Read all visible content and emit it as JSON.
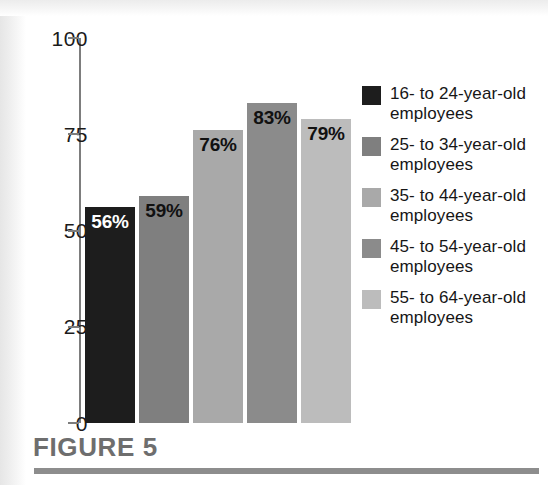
{
  "figure": {
    "caption": "FIGURE 5",
    "rule_color": "#8d8d8d",
    "caption_color": "#6e6e6e"
  },
  "axis": {
    "ticks": [
      "100",
      "75",
      "50",
      "25",
      "0"
    ],
    "line_color": "#7d7d7d"
  },
  "legend": {
    "items": [
      {
        "label": "16- to 24-year-old employees",
        "color": "#1d1d1d"
      },
      {
        "label": "25- to 34-year-old employees",
        "color": "#7f7f7f"
      },
      {
        "label": "35- to 44-year-old employees",
        "color": "#a9a9a9"
      },
      {
        "label": "45- to 54-year-old employees",
        "color": "#8b8b8b"
      },
      {
        "label": "55- to 64-year-old employees",
        "color": "#bcbcbc"
      }
    ]
  },
  "chart_data": {
    "type": "bar",
    "title": "FIGURE 5",
    "xlabel": "",
    "ylabel": "",
    "ylim": [
      0,
      100
    ],
    "yticks": [
      0,
      25,
      50,
      75,
      100
    ],
    "grid": false,
    "legend_position": "right",
    "categories": [
      "16- to 24-year-old employees",
      "25- to 34-year-old employees",
      "35- to 44-year-old employees",
      "45- to 54-year-old employees",
      "55- to 64-year-old employees"
    ],
    "values": [
      56,
      59,
      76,
      83,
      79
    ],
    "data_labels": [
      "56%",
      "59%",
      "76%",
      "83%",
      "79%"
    ],
    "bar_colors": [
      "#1d1d1d",
      "#7f7f7f",
      "#a9a9a9",
      "#8b8b8b",
      "#bcbcbc"
    ],
    "label_text_colors": [
      "#ffffff",
      "#111111",
      "#111111",
      "#111111",
      "#111111"
    ]
  }
}
